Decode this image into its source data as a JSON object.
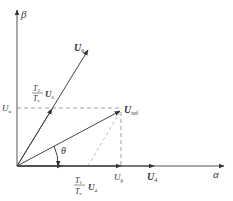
{
  "diagram": {
    "axes": {
      "beta": {
        "label": "β"
      },
      "alpha": {
        "label": "α"
      }
    },
    "vectors": {
      "u6": {
        "label": "U",
        "sub": "6"
      },
      "u4": {
        "label": "U",
        "sub": "4"
      },
      "uref": {
        "label": "U",
        "sub": "ref"
      },
      "t2_u6": {
        "num": "T",
        "num_sub": "2",
        "den": "T",
        "den_sub": "s",
        "label": "U",
        "sub": "6"
      },
      "t1_u4": {
        "num": "T",
        "num_sub": "1",
        "den": "T",
        "den_sub": "s",
        "label": "U",
        "sub": "4"
      }
    },
    "projections": {
      "u_alpha": {
        "label": "U",
        "sub": "α"
      },
      "u_beta": {
        "label": "U",
        "sub": "β"
      }
    },
    "angle": {
      "label": "θ"
    },
    "colors": {
      "line": "#444444",
      "dash": "#777777",
      "text": "#333333"
    }
  }
}
